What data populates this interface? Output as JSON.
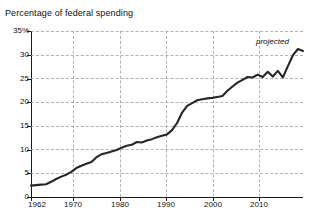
{
  "chart_data": {
    "type": "line",
    "title": "Percentage of federal spending",
    "xlabel": "",
    "ylabel": "",
    "ylim": [
      0,
      35
    ],
    "xlim": [
      1962,
      2016
    ],
    "grid": true,
    "legend": false,
    "ytick_labels": [
      "35%",
      "30",
      "25",
      "20",
      "15",
      "10",
      "5",
      "0"
    ],
    "ytick_values": [
      35,
      30,
      25,
      20,
      15,
      10,
      5,
      0
    ],
    "xtick_labels": [
      "1962",
      "1970",
      "1980",
      "1990",
      "2000",
      "2010"
    ],
    "xtick_values": [
      1962,
      1970,
      1980,
      1990,
      2000,
      2010
    ],
    "annotations": [
      {
        "text": "projected",
        "x": 2013,
        "y": 34,
        "style": "italic"
      }
    ],
    "series": [
      {
        "name": "Percentage of federal spending",
        "x": [
          1962,
          1963,
          1964,
          1965,
          1966,
          1967,
          1968,
          1969,
          1970,
          1971,
          1972,
          1973,
          1974,
          1975,
          1976,
          1977,
          1978,
          1979,
          1980,
          1981,
          1982,
          1983,
          1984,
          1985,
          1986,
          1987,
          1988,
          1989,
          1990,
          1991,
          1992,
          1993,
          1994,
          1995,
          1996,
          1997,
          1998,
          1999,
          2000,
          2001,
          2002,
          2003,
          2004,
          2005,
          2006,
          2007,
          2008,
          2009,
          2010,
          2011,
          2012,
          2013,
          2014,
          2015,
          2016
        ],
        "values": [
          2.4,
          2.5,
          2.6,
          2.7,
          3.2,
          3.8,
          4.3,
          4.7,
          5.3,
          6.1,
          6.6,
          7.0,
          7.4,
          8.4,
          9.0,
          9.3,
          9.6,
          9.9,
          10.4,
          10.8,
          11.0,
          11.6,
          11.5,
          11.9,
          12.2,
          12.6,
          12.9,
          13.2,
          14.1,
          15.6,
          17.8,
          19.2,
          19.8,
          20.4,
          20.6,
          20.8,
          20.9,
          21.1,
          21.3,
          22.4,
          23.3,
          24.1,
          24.7,
          25.3,
          25.2,
          25.8,
          25.3,
          26.4,
          25.4,
          26.6,
          25.2,
          27.6,
          29.9,
          31.2,
          30.8
        ]
      }
    ]
  }
}
